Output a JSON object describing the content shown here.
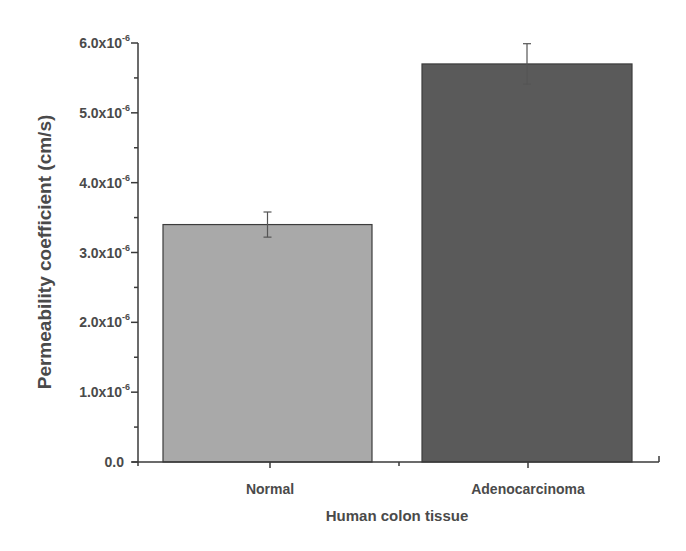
{
  "chart_data": {
    "type": "bar",
    "title": "",
    "xlabel": "Human colon tissue",
    "ylabel": "Permeability coefficient (cm/s)",
    "categories": [
      "Normal",
      "Adenocarcinoma"
    ],
    "values": [
      3.4e-06,
      5.7e-06
    ],
    "error": [
      1.8e-07,
      2.9e-07
    ],
    "colors": [
      "#a9a9a9",
      "#5a5a5a"
    ],
    "ylim": [
      0,
      6e-06
    ],
    "yticks": [
      {
        "value": 0,
        "label": "0.0"
      },
      {
        "value": 1e-06,
        "label": "1.0x10",
        "exp": "-6"
      },
      {
        "value": 2e-06,
        "label": "2.0x10",
        "exp": "-6"
      },
      {
        "value": 3e-06,
        "label": "3.0x10",
        "exp": "-6"
      },
      {
        "value": 4e-06,
        "label": "4.0x10",
        "exp": "-6"
      },
      {
        "value": 5e-06,
        "label": "5.0x10",
        "exp": "-6"
      },
      {
        "value": 6e-06,
        "label": "6.0x10",
        "exp": "-6"
      }
    ],
    "grid": false,
    "legend": null
  }
}
